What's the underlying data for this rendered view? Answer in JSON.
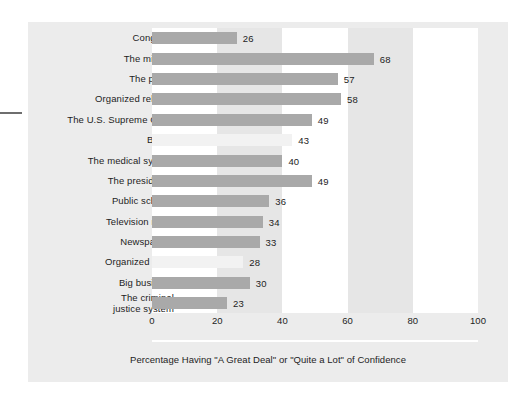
{
  "figure": {
    "caption": "Percentage Having \"A Great Deal\" or \"Quite a Lot\" of Confidence"
  },
  "axis": {
    "ticks": [
      "0",
      "20",
      "40",
      "60",
      "80",
      "100"
    ]
  },
  "chart_data": {
    "type": "bar",
    "orientation": "horizontal",
    "title": "",
    "subtitle": "",
    "xlabel": "Percentage Having \"A Great Deal\" or \"Quite a Lot\" of Confidence",
    "ylabel": "",
    "xlim": [
      0,
      100
    ],
    "xticks": [
      0,
      20,
      40,
      60,
      80,
      100
    ],
    "grid": false,
    "legend": null,
    "bar_color": "#a9a9a9",
    "faded_bar_color": "#f2f2f2",
    "band_colors": [
      "#ffffff",
      "#e6e6e6"
    ],
    "background": "#ececec",
    "categories": [
      "Congress",
      "The military",
      "The police",
      "Organized religion",
      "The U.S. Supreme Court",
      "Banks",
      "The medical system",
      "The presidency",
      "Public schools",
      "Television news",
      "Newspapers",
      "Organized labor",
      "Big business",
      "The criminal\njustice system"
    ],
    "values": [
      26,
      68,
      57,
      58,
      49,
      43,
      40,
      49,
      36,
      34,
      33,
      28,
      30,
      23
    ],
    "value_labels": [
      "26",
      "68",
      "57",
      "58",
      "49",
      "43",
      "40",
      "49",
      "36",
      "34",
      "33",
      "28",
      "30",
      "23"
    ],
    "faded": [
      false,
      false,
      false,
      false,
      false,
      true,
      false,
      false,
      false,
      false,
      false,
      true,
      false,
      false
    ]
  }
}
